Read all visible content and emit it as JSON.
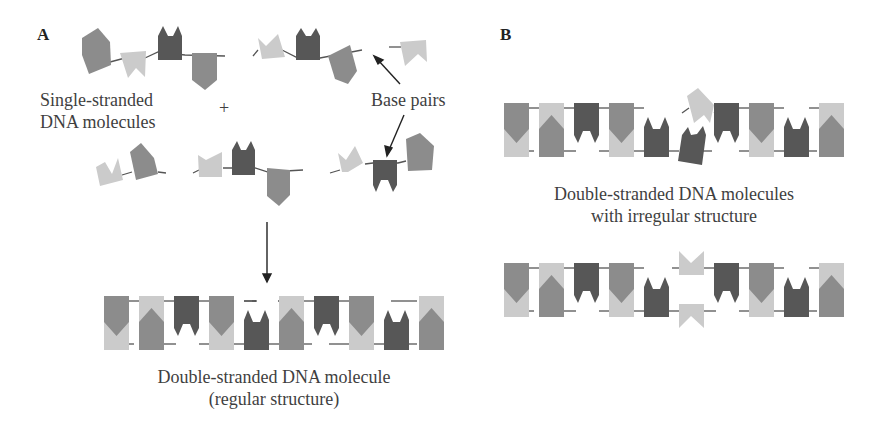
{
  "colors": {
    "mid_gray": "#8c8c8c",
    "light_gray": "#cbcbcb",
    "dark_gray": "#575757",
    "strand": "#555555",
    "text": "#3f3f3f"
  },
  "panel_a": {
    "label": "A",
    "single_strand_label_line1": "Single-stranded",
    "single_strand_label_line2": "DNA molecules",
    "plus_sign": "+",
    "base_pairs_label": "Base pairs",
    "result_caption_line1": "Double-stranded DNA molecule",
    "result_caption_line2": "(regular structure)"
  },
  "panel_b": {
    "label": "B",
    "caption_line1": "Double-stranded DNA molecules",
    "caption_line2": "with irregular structure"
  },
  "double_strand_sequence_regular": {
    "top": [
      "mid",
      "light",
      "dark",
      "mid",
      "gap",
      "light",
      "dark",
      "mid",
      "gap",
      "light"
    ],
    "bottom": [
      "light",
      "mid",
      "gap",
      "light",
      "dark",
      "mid",
      "gap",
      "light",
      "dark",
      "mid"
    ]
  }
}
